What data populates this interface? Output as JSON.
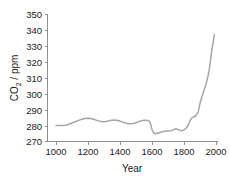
{
  "chart_data": {
    "type": "line",
    "title": "",
    "xlabel": "Year",
    "ylabel": "CO2 / ppm",
    "ylabel_prefix": "CO",
    "ylabel_sub": "2",
    "ylabel_suffix": " / ppm",
    "xlim": [
      950,
      2010
    ],
    "ylim": [
      270,
      350
    ],
    "xticks": [
      1000,
      1200,
      1400,
      1600,
      1800,
      2000
    ],
    "xtick_labels": [
      "1000",
      "1200",
      "1400",
      "1600",
      "1800",
      "2000"
    ],
    "yticks": [
      270,
      280,
      290,
      300,
      310,
      320,
      330,
      340,
      350
    ],
    "ytick_labels": [
      "270",
      "280",
      "290",
      "300",
      "310",
      "320",
      "330",
      "340",
      "350"
    ],
    "grid": false,
    "legend": "none",
    "line_color": "#a6a6a6",
    "axis_color": "#8c8c8c",
    "text_color": "#1a1a1a",
    "series": [
      {
        "name": "Atmospheric CO2 concentration",
        "x": [
          1000,
          1020,
          1040,
          1060,
          1080,
          1100,
          1120,
          1140,
          1160,
          1180,
          1200,
          1220,
          1240,
          1260,
          1280,
          1300,
          1320,
          1340,
          1360,
          1380,
          1400,
          1420,
          1440,
          1460,
          1480,
          1500,
          1520,
          1540,
          1560,
          1580,
          1590,
          1600,
          1610,
          1620,
          1640,
          1660,
          1680,
          1700,
          1720,
          1740,
          1750,
          1760,
          1780,
          1800,
          1820,
          1840,
          1850,
          1860,
          1870,
          1880,
          1890,
          1900,
          1910,
          1920,
          1930,
          1940,
          1950,
          1960,
          1970,
          1980,
          1990
        ],
        "y": [
          280.0,
          280.0,
          280.0,
          280.2,
          280.8,
          281.6,
          282.4,
          283.2,
          283.9,
          284.4,
          284.6,
          284.4,
          283.8,
          283.1,
          282.6,
          282.4,
          282.7,
          283.2,
          283.5,
          283.3,
          282.8,
          282.1,
          281.5,
          281.2,
          281.3,
          281.8,
          282.6,
          283.2,
          283.4,
          283.0,
          281.5,
          277.5,
          275.4,
          274.8,
          275.3,
          276.0,
          276.4,
          276.6,
          276.8,
          277.6,
          278.0,
          277.6,
          276.8,
          277.2,
          279.0,
          283.5,
          285.0,
          285.4,
          285.8,
          287.0,
          289.0,
          294.0,
          297.5,
          300.5,
          303.5,
          307.0,
          311.0,
          316.5,
          324.5,
          331.0,
          337.0
        ]
      }
    ]
  },
  "axis": {
    "x_title": "Year",
    "y_title_main": "CO",
    "y_title_sub": "2",
    "y_title_rest": " / ppm"
  }
}
